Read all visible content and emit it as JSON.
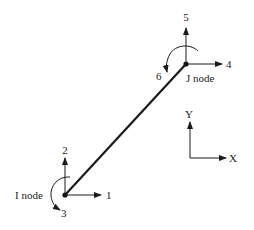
{
  "diagram": {
    "element": {
      "from": "I node",
      "to": "J node"
    },
    "nodes": {
      "i": {
        "label": "I node",
        "dofs": {
          "x": "1",
          "y": "2",
          "rot": "3"
        }
      },
      "j": {
        "label": "J node",
        "dofs": {
          "x": "4",
          "y": "5",
          "rot": "6"
        }
      }
    },
    "axes": {
      "x_label": "X",
      "y_label": "Y"
    },
    "colors": {
      "line": "#1a1a1a",
      "background": "#ffffff"
    }
  }
}
